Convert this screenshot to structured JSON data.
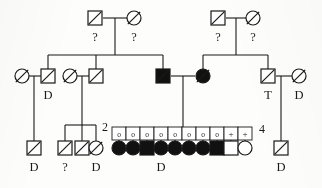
{
  "figure": {
    "type": "pedigree-chart",
    "title": "",
    "width": 322,
    "height": 188,
    "background_color": "#fdfdfb",
    "line_color": "#1a1a1a",
    "fill_affected_color": "#111111",
    "fill_unaffected_color": "#ffffff"
  },
  "legend_symbols": {
    "square": "male",
    "circle": "female",
    "filled": "affected",
    "slash": "deceased",
    "question_mark": "status unknown",
    "letter_D": "D",
    "letter_T": "T",
    "letter_o": "o",
    "plus": "+"
  },
  "chart_data": {
    "type": "diagram",
    "generations": [
      {
        "id": "I",
        "members": [
          {
            "id": "I-1",
            "sex": "male",
            "shape": "square",
            "affected": false,
            "deceased": true,
            "label_below": "?",
            "label_above": "",
            "x": 95,
            "y": 18
          },
          {
            "id": "I-2",
            "sex": "female",
            "shape": "circle",
            "affected": false,
            "deceased": true,
            "label_below": "?",
            "label_above": "",
            "x": 134,
            "y": 18
          },
          {
            "id": "I-3",
            "sex": "male",
            "shape": "square",
            "affected": false,
            "deceased": true,
            "label_below": "?",
            "label_above": "",
            "x": 218,
            "y": 18
          },
          {
            "id": "I-4",
            "sex": "female",
            "shape": "circle",
            "affected": false,
            "deceased": true,
            "label_below": "?",
            "label_above": "",
            "x": 253,
            "y": 18
          }
        ]
      },
      {
        "id": "II",
        "members": [
          {
            "id": "II-1",
            "sex": "female",
            "shape": "circle",
            "affected": false,
            "deceased": true,
            "label_below": "",
            "label_above": "",
            "x": 22,
            "y": 76
          },
          {
            "id": "II-2",
            "sex": "male",
            "shape": "square",
            "affected": false,
            "deceased": true,
            "label_below": "D",
            "label_above": "",
            "x": 48,
            "y": 76
          },
          {
            "id": "II-3",
            "sex": "female",
            "shape": "circle",
            "affected": false,
            "deceased": true,
            "label_below": "",
            "label_above": "",
            "x": 70,
            "y": 76
          },
          {
            "id": "II-4",
            "sex": "male",
            "shape": "square",
            "affected": false,
            "deceased": true,
            "label_below": "",
            "label_above": "",
            "x": 96,
            "y": 76
          },
          {
            "id": "II-5",
            "sex": "male",
            "shape": "square",
            "affected": true,
            "deceased": true,
            "label_below": "",
            "label_above": "",
            "x": 163,
            "y": 76
          },
          {
            "id": "II-6",
            "sex": "female",
            "shape": "circle",
            "affected": true,
            "deceased": true,
            "label_below": "",
            "label_above": "",
            "x": 203,
            "y": 76
          },
          {
            "id": "II-7",
            "sex": "male",
            "shape": "square",
            "affected": false,
            "deceased": true,
            "label_below": "T",
            "label_above": "",
            "x": 268,
            "y": 76
          },
          {
            "id": "II-8",
            "sex": "female",
            "shape": "circle",
            "affected": false,
            "deceased": true,
            "label_below": "D",
            "label_above": "",
            "x": 299,
            "y": 76
          }
        ]
      },
      {
        "id": "III",
        "members": [
          {
            "id": "III-1",
            "sex": "male",
            "shape": "square",
            "affected": false,
            "deceased": true,
            "label_below": "D",
            "label_above": "",
            "x": 34,
            "y": 148
          },
          {
            "id": "III-2",
            "sex": "male",
            "shape": "square",
            "affected": false,
            "deceased": true,
            "label_below": "?",
            "label_above": "",
            "x": 65,
            "y": 148
          },
          {
            "id": "III-3",
            "sex": "male",
            "shape": "square",
            "affected": false,
            "deceased": true,
            "label_below": "",
            "label_above": "",
            "x": 82,
            "y": 148
          },
          {
            "id": "III-4",
            "sex": "female",
            "shape": "circle",
            "affected": false,
            "deceased": true,
            "label_below": "D",
            "label_above": "",
            "x": 96,
            "y": 148
          },
          {
            "id": "III-5",
            "sex": "female",
            "shape": "circle",
            "affected": true,
            "deceased": false,
            "label_below": "",
            "label_above": "o",
            "x": 119,
            "y": 148
          },
          {
            "id": "III-6",
            "sex": "female",
            "shape": "circle",
            "affected": true,
            "deceased": false,
            "label_below": "",
            "label_above": "o",
            "x": 133,
            "y": 148
          },
          {
            "id": "III-7",
            "sex": "male",
            "shape": "square",
            "affected": true,
            "deceased": false,
            "label_below": "",
            "label_above": "o",
            "x": 147,
            "y": 148
          },
          {
            "id": "III-8",
            "sex": "female",
            "shape": "circle",
            "affected": true,
            "deceased": false,
            "label_below": "D",
            "label_above": "o",
            "x": 161,
            "y": 148
          },
          {
            "id": "III-9",
            "sex": "female",
            "shape": "circle",
            "affected": true,
            "deceased": false,
            "label_below": "",
            "label_above": "o",
            "x": 175,
            "y": 148
          },
          {
            "id": "III-10",
            "sex": "female",
            "shape": "circle",
            "affected": true,
            "deceased": false,
            "label_below": "",
            "label_above": "o",
            "x": 189,
            "y": 148
          },
          {
            "id": "III-11",
            "sex": "female",
            "shape": "circle",
            "affected": true,
            "deceased": false,
            "label_below": "",
            "label_above": "o",
            "x": 203,
            "y": 148
          },
          {
            "id": "III-12",
            "sex": "male",
            "shape": "square",
            "affected": true,
            "deceased": false,
            "label_below": "",
            "label_above": "o",
            "x": 217,
            "y": 148
          },
          {
            "id": "III-13",
            "sex": "male",
            "shape": "square",
            "affected": false,
            "deceased": false,
            "label_below": "",
            "label_above": "+",
            "x": 231,
            "y": 148
          },
          {
            "id": "III-14",
            "sex": "female",
            "shape": "circle",
            "affected": false,
            "deceased": false,
            "label_below": "",
            "label_above": "+",
            "x": 245,
            "y": 148
          },
          {
            "id": "III-15",
            "sex": "male",
            "shape": "square",
            "affected": false,
            "deceased": true,
            "label_below": "D",
            "label_above": "",
            "x": 281,
            "y": 148
          }
        ]
      }
    ],
    "sibship_counts": [
      {
        "id": "count-2",
        "value": "2",
        "x": 105,
        "y": 131
      },
      {
        "id": "count-4",
        "value": "4",
        "x": 262,
        "y": 133
      }
    ],
    "matings": [
      {
        "id": "mating-I-left",
        "partners": [
          "I-1",
          "I-2"
        ],
        "children": [
          "II-2",
          "II-4",
          "II-5"
        ]
      },
      {
        "id": "mating-I-right",
        "partners": [
          "I-3",
          "I-4"
        ],
        "children": [
          "II-6",
          "II-7"
        ]
      },
      {
        "id": "mating-II-a",
        "partners": [
          "II-1",
          "II-2"
        ],
        "children": [
          "III-1"
        ]
      },
      {
        "id": "mating-II-b",
        "partners": [
          "II-3",
          "II-4"
        ],
        "children": [
          "III-2",
          "III-3",
          "III-4"
        ]
      },
      {
        "id": "mating-II-c",
        "partners": [
          "II-5",
          "II-6"
        ],
        "children": [
          "III-5",
          "III-6",
          "III-7",
          "III-8",
          "III-9",
          "III-10",
          "III-11",
          "III-12",
          "III-13",
          "III-14"
        ]
      },
      {
        "id": "mating-II-d",
        "partners": [
          "II-7",
          "II-8"
        ],
        "children": [
          "III-15"
        ]
      }
    ]
  }
}
